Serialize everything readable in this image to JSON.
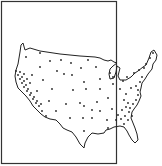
{
  "map": {
    "width": 162,
    "height": 166,
    "background": "#ffffff",
    "ink": "#222222",
    "frame": {
      "x": 1.5,
      "y": 1.5,
      "w": 115,
      "h": 162
    },
    "outline_path": "M21,45 L23,43 L25,50 L30,48 L40,51 L60,54 L80,56 L95,57 L100,58 L104,60 L108,61 L111,60 L114,62 L117,63 L113,66 L110,69 L109,74 L110,79 L114,78 L116,72 L117,66 L120,68 L118,76 L120,80 L126,80 L131,77 L135,73 L138,71 L143,67 L146,65 L149,58 L151,52 L154,50 L157,55 L156,60 L153,64 L152,69 L148,74 L145,79 L142,83 L141,88 L140,92 L141,96 L139,101 L137,105 L134,109 L132,112 L131,118 L133,123 L135,128 L137,134 L138,140 L135,143 L132,140 L129,135 L127,131 L124,127 L120,126 L114,127 L110,129 L106,130 L104,133 L98,134 L92,133 L88,137 L85,143 L84,148 L80,144 L76,137 L72,132 L67,130 L63,128 L60,124 L56,120 L50,119 L45,117 L41,114 L37,110 L33,106 L30,101 L26,96 L22,92 L18,88 L16,82 L15,76 L16,70 L18,64 L19,58 L20,52 Z",
    "dots": [
      [
        26,
        57
      ],
      [
        40,
        53
      ],
      [
        50,
        61
      ],
      [
        61,
        60
      ],
      [
        71,
        63
      ],
      [
        88,
        60
      ],
      [
        40,
        67
      ],
      [
        57,
        71
      ],
      [
        72,
        75
      ],
      [
        81,
        68
      ],
      [
        96,
        67
      ],
      [
        110,
        73
      ],
      [
        113,
        77
      ],
      [
        32,
        75
      ],
      [
        43,
        80
      ],
      [
        64,
        74
      ],
      [
        84,
        82
      ],
      [
        100,
        79
      ],
      [
        113,
        84
      ],
      [
        123,
        81
      ],
      [
        127,
        77
      ],
      [
        134,
        73
      ],
      [
        139,
        70
      ],
      [
        144,
        68
      ],
      [
        146,
        64
      ],
      [
        150,
        58
      ],
      [
        153,
        53
      ],
      [
        37,
        91
      ],
      [
        52,
        89
      ],
      [
        73,
        90
      ],
      [
        86,
        89
      ],
      [
        100,
        89
      ],
      [
        120,
        89
      ],
      [
        131,
        88
      ],
      [
        136,
        86
      ],
      [
        140,
        82
      ],
      [
        142,
        77
      ],
      [
        49,
        101
      ],
      [
        66,
        104
      ],
      [
        80,
        103
      ],
      [
        97,
        102
      ],
      [
        108,
        98
      ],
      [
        126,
        94
      ],
      [
        138,
        90
      ],
      [
        138,
        95
      ],
      [
        136,
        100
      ],
      [
        133,
        104
      ],
      [
        130,
        108
      ],
      [
        56,
        111
      ],
      [
        84,
        106
      ],
      [
        92,
        110
      ],
      [
        100,
        111
      ],
      [
        112,
        109
      ],
      [
        124,
        100
      ],
      [
        128,
        103
      ],
      [
        126,
        107
      ],
      [
        122,
        110
      ],
      [
        118,
        115
      ],
      [
        129,
        112
      ],
      [
        125,
        116
      ],
      [
        70,
        118
      ],
      [
        83,
        118
      ],
      [
        92,
        118
      ],
      [
        107,
        120
      ],
      [
        116,
        120
      ],
      [
        121,
        119
      ],
      [
        132,
        116
      ],
      [
        128,
        120
      ],
      [
        84,
        131
      ],
      [
        108,
        128
      ],
      [
        124,
        124
      ],
      [
        16,
        71
      ],
      [
        18,
        75
      ],
      [
        20,
        79
      ],
      [
        22,
        83
      ],
      [
        24,
        87
      ],
      [
        27,
        91
      ],
      [
        30,
        95
      ],
      [
        33,
        99
      ],
      [
        36,
        103
      ],
      [
        39,
        106
      ],
      [
        42,
        111
      ],
      [
        46,
        116
      ],
      [
        20,
        72
      ],
      [
        22,
        77
      ],
      [
        24,
        81
      ],
      [
        26,
        85
      ],
      [
        28,
        89
      ],
      [
        31,
        93
      ],
      [
        34,
        97
      ],
      [
        37,
        101
      ],
      [
        41,
        104
      ],
      [
        24,
        74
      ],
      [
        27,
        79
      ],
      [
        30,
        83
      ]
    ]
  }
}
